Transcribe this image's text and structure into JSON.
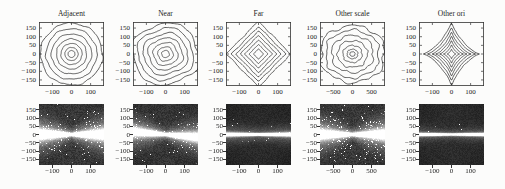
{
  "figure": {
    "background": "#fcfcfb",
    "column_titles": [
      "Adjacent",
      "Near",
      "Far",
      "Other scale",
      "Other ori"
    ],
    "line_color": "#2b2b2b",
    "axis_color": "#333333"
  },
  "chart_data": [
    {
      "row": "top",
      "type": "contour",
      "legend": "none",
      "grid": false,
      "panels": [
        {
          "title": "Adjacent",
          "xlim": [
            -170,
            170
          ],
          "ylim": [
            -185,
            185
          ],
          "x_ticks": [
            -100,
            0,
            100
          ],
          "y_ticks": [
            150,
            100,
            50,
            0,
            -50,
            -100,
            -150
          ],
          "ring_radii": [
            179,
            147,
            116,
            87,
            61,
            38,
            20
          ],
          "shape": {
            "superellipse_p": 2.0,
            "rotation_deg": 0,
            "scale_x": 1.0,
            "scale_y": 1.0,
            "waviness": 0.035,
            "seed": 11
          },
          "description": "concentric wavy circles"
        },
        {
          "title": "Near",
          "xlim": [
            -170,
            170
          ],
          "ylim": [
            -185,
            185
          ],
          "x_ticks": [
            -100,
            0,
            100
          ],
          "y_ticks": [
            150,
            100,
            50,
            0,
            -50,
            -100,
            -150
          ],
          "ring_radii": [
            173,
            145,
            116,
            90,
            64,
            40,
            20
          ],
          "shape": {
            "superellipse_p": 3.0,
            "rotation_deg": 22,
            "scale_x": 1.05,
            "scale_y": 0.97,
            "waviness": 0.04,
            "seed": 22
          },
          "description": "concentric rounded squares rotated about 22 degrees"
        },
        {
          "title": "Far",
          "xlim": [
            -170,
            170
          ],
          "ylim": [
            -185,
            185
          ],
          "x_ticks": [
            -100,
            0,
            100
          ],
          "y_ticks": [
            150,
            100,
            50,
            0,
            -50,
            -100,
            -150
          ],
          "ring_radii": [
            190,
            160,
            134,
            108,
            82,
            56,
            30
          ],
          "shape": {
            "superellipse_p": 1.0,
            "rotation_deg": 0,
            "scale_x": 0.98,
            "scale_y": 1.0,
            "waviness": 0.025,
            "seed": 33
          },
          "description": "concentric diamonds"
        },
        {
          "title": "Other scale",
          "xlim": [
            -850,
            850
          ],
          "ylim": [
            -185,
            185
          ],
          "x_ticks": [
            -500,
            0,
            500
          ],
          "y_ticks": [
            150,
            100,
            50,
            0,
            -50,
            -100,
            -150
          ],
          "ring_radii": [
            173,
            145,
            113,
            81,
            52,
            29,
            14
          ],
          "shape": {
            "superellipse_p": 2.2,
            "rotation_deg": 0,
            "scale_x": 1.06,
            "scale_y": 0.94,
            "waviness": 0.085,
            "seed": 44
          },
          "description": "irregular bumpy concentric rings"
        },
        {
          "title": "Other ori",
          "xlim": [
            -170,
            170
          ],
          "ylim": [
            -185,
            185
          ],
          "x_ticks": [
            -100,
            0,
            100
          ],
          "y_ticks": [
            150,
            100,
            50,
            0,
            -50,
            -100,
            -150
          ],
          "ring_radii": [
            190,
            162,
            133,
            107,
            81,
            55,
            29
          ],
          "shape": {
            "superellipse_p": 0.75,
            "rotation_deg": 0,
            "scale_x": 0.85,
            "scale_y": 1.0,
            "waviness": 0.02,
            "seed": 55
          },
          "description": "concentric concave four-pointed diamond stars"
        }
      ]
    },
    {
      "row": "bottom",
      "type": "heatmap",
      "colormap": "gray",
      "panels": [
        {
          "column": "Adjacent",
          "xlim": [
            -170,
            170
          ],
          "ylim": [
            -185,
            185
          ],
          "x_ticks": [
            -100,
            0,
            100
          ],
          "y_ticks": [
            150,
            100,
            50,
            0,
            -50,
            -100,
            -150
          ],
          "pattern": {
            "description": "bright horizontal bow-tie band pinched at the origin with speckled bright patches left and right",
            "base": 42,
            "noise": 30,
            "band_amp": 215,
            "core_sigma0": 1.2,
            "core_sigma_slope": 0.1,
            "halo_amp": 95,
            "halo_sigma0": 3.5,
            "halo_sigma_slope": 0.3,
            "tilt": 0,
            "speckle_prob": 0.08,
            "speckle_sigma": 13,
            "seed": 101
          }
        },
        {
          "column": "Near",
          "xlim": [
            -170,
            170
          ],
          "ylim": [
            -185,
            185
          ],
          "x_ticks": [
            -100,
            0,
            100
          ],
          "y_ticks": [
            150,
            100,
            50,
            0,
            -50,
            -100,
            -150
          ],
          "pattern": {
            "description": "slightly tilted bright horizontal band with speckle",
            "base": 40,
            "noise": 28,
            "band_amp": 205,
            "core_sigma0": 1.3,
            "core_sigma_slope": 0.08,
            "halo_amp": 85,
            "halo_sigma0": 3.5,
            "halo_sigma_slope": 0.26,
            "tilt": 0.09,
            "speckle_prob": 0.055,
            "speckle_sigma": 12,
            "seed": 202
          }
        },
        {
          "column": "Far",
          "xlim": [
            -170,
            170
          ],
          "ylim": [
            -185,
            185
          ],
          "x_ticks": [
            -100,
            0,
            100
          ],
          "y_ticks": [
            150,
            100,
            50,
            0,
            -50,
            -100,
            -150
          ],
          "pattern": {
            "description": "thin bright horizontal line on dark background",
            "base": 34,
            "noise": 18,
            "band_amp": 255,
            "core_sigma0": 1.0,
            "core_sigma_slope": 0.02,
            "halo_amp": 55,
            "halo_sigma0": 4.5,
            "halo_sigma_slope": 0.06,
            "tilt": 0,
            "speckle_prob": 0.012,
            "speckle_sigma": 8,
            "seed": 303
          }
        },
        {
          "column": "Other scale",
          "xlim": [
            -850,
            850
          ],
          "ylim": [
            -185,
            185
          ],
          "x_ticks": [
            -500,
            0,
            500
          ],
          "y_ticks": [
            150,
            100,
            50,
            0,
            -50,
            -100,
            -150
          ],
          "pattern": {
            "description": "bright horizontal bow-tie band with heavy speckled bright patches left and right",
            "base": 42,
            "noise": 30,
            "band_amp": 220,
            "core_sigma0": 1.2,
            "core_sigma_slope": 0.09,
            "halo_amp": 95,
            "halo_sigma0": 3.5,
            "halo_sigma_slope": 0.3,
            "tilt": 0,
            "speckle_prob": 0.1,
            "speckle_sigma": 15,
            "seed": 404
          }
        },
        {
          "column": "Other ori",
          "xlim": [
            -170,
            170
          ],
          "ylim": [
            -185,
            185
          ],
          "x_ticks": [
            -100,
            0,
            100
          ],
          "y_ticks": [
            150,
            100,
            50,
            0,
            -50,
            -100,
            -150
          ],
          "pattern": {
            "description": "very thin very bright horizontal line on dark background",
            "base": 36,
            "noise": 18,
            "band_amp": 255,
            "core_sigma0": 0.9,
            "core_sigma_slope": 0.012,
            "halo_amp": 45,
            "halo_sigma0": 3.5,
            "halo_sigma_slope": 0.05,
            "tilt": 0,
            "speckle_prob": 0.008,
            "speckle_sigma": 7,
            "seed": 505
          }
        }
      ]
    }
  ]
}
